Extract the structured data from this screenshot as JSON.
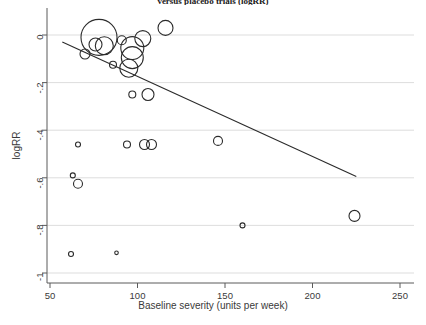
{
  "chart_data": {
    "type": "scatter",
    "title": "versus placebo trials (logRR)",
    "xlabel": "Baseline severity (units per week)",
    "ylabel": "logRR",
    "xlim": [
      50,
      250
    ],
    "ylim": [
      -1,
      0.06
    ],
    "xticks": [
      50,
      100,
      150,
      200,
      250
    ],
    "xticklabels": [
      "50",
      "100",
      "150",
      "200",
      "250"
    ],
    "yticks": [
      0,
      -0.2,
      -0.4,
      -0.6,
      -0.8,
      -1
    ],
    "yticklabels": [
      "0",
      "-.2",
      "-.4",
      "-.6",
      "-.8",
      "-1"
    ],
    "grid": "horizontal",
    "legend": "none",
    "marker": "open-circle",
    "size_encodes": "study weight",
    "points": [
      {
        "x": 78,
        "y": -0.01,
        "r": 18.0
      },
      {
        "x": 76,
        "y": -0.04,
        "r": 6.5
      },
      {
        "x": 81,
        "y": -0.045,
        "r": 9.0
      },
      {
        "x": 70,
        "y": -0.08,
        "r": 5.0
      },
      {
        "x": 91,
        "y": -0.022,
        "r": 4.5
      },
      {
        "x": 97,
        "y": -0.055,
        "r": 11.5
      },
      {
        "x": 97,
        "y": -0.095,
        "r": 11.0
      },
      {
        "x": 103,
        "y": -0.015,
        "r": 8.0
      },
      {
        "x": 116,
        "y": 0.03,
        "r": 7.5
      },
      {
        "x": 95,
        "y": -0.14,
        "r": 9.0
      },
      {
        "x": 86,
        "y": -0.125,
        "r": 3.5
      },
      {
        "x": 97,
        "y": -0.25,
        "r": 3.5
      },
      {
        "x": 106,
        "y": -0.25,
        "r": 6.0
      },
      {
        "x": 66,
        "y": -0.46,
        "r": 2.5
      },
      {
        "x": 94,
        "y": -0.46,
        "r": 3.5
      },
      {
        "x": 104,
        "y": -0.46,
        "r": 5.0
      },
      {
        "x": 108,
        "y": -0.46,
        "r": 5.0
      },
      {
        "x": 146,
        "y": -0.445,
        "r": 4.5
      },
      {
        "x": 63,
        "y": -0.59,
        "r": 2.5
      },
      {
        "x": 66,
        "y": -0.625,
        "r": 4.5
      },
      {
        "x": 224,
        "y": -0.76,
        "r": 5.5
      },
      {
        "x": 160,
        "y": -0.8,
        "r": 2.5
      },
      {
        "x": 62,
        "y": -0.92,
        "r": 2.5
      },
      {
        "x": 88,
        "y": -0.915,
        "r": 1.8
      }
    ],
    "fit_line": {
      "label": "meta-regression line",
      "x_start": 57,
      "y_start": -0.03,
      "x_end": 225,
      "y_end": -0.595
    }
  }
}
